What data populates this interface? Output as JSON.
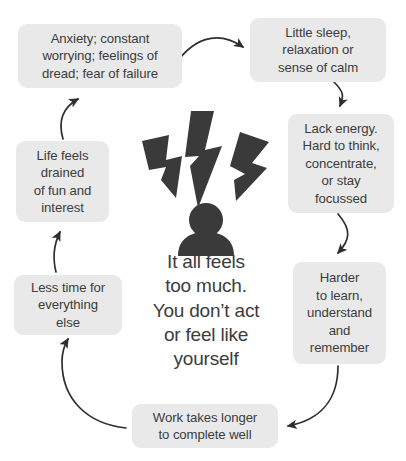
{
  "diagram": {
    "type": "cycle",
    "title": "",
    "center": {
      "icon": "stressed-person-lightning-icon",
      "text": "It all feels\ntoo much.\nYou don’t act\nor feel like\nyourself"
    },
    "colors": {
      "node_background": "#e9e9e9",
      "text": "#3c3c3c",
      "arrow": "#2e2e2e",
      "icon": "#3a3a3a",
      "page_background": "#ffffff"
    },
    "nodes": [
      {
        "id": "anxiety",
        "label": "Anxiety; constant\nworrying; feelings of\ndread; fear of failure"
      },
      {
        "id": "sleep",
        "label": "Little sleep,\nrelaxation or\nsense of calm"
      },
      {
        "id": "energy",
        "label": "Lack energy.\nHard to think,\nconcentrate,\nor stay\nfocussed"
      },
      {
        "id": "learn",
        "label": "Harder\nto learn,\nunderstand\nand\nremember"
      },
      {
        "id": "work",
        "label": "Work takes longer\nto complete well"
      },
      {
        "id": "lesstime",
        "label": "Less time for\neverything\nelse"
      },
      {
        "id": "lifefeels",
        "label": "Life feels\ndrained\nof fun and\ninterest"
      }
    ],
    "connections": [
      {
        "from": "anxiety",
        "to": "sleep"
      },
      {
        "from": "sleep",
        "to": "energy"
      },
      {
        "from": "energy",
        "to": "learn"
      },
      {
        "from": "learn",
        "to": "work"
      },
      {
        "from": "work",
        "to": "lesstime"
      },
      {
        "from": "lesstime",
        "to": "lifefeels"
      },
      {
        "from": "lifefeels",
        "to": "anxiety"
      }
    ]
  }
}
